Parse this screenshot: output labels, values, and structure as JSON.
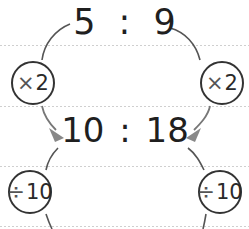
{
  "diagram": {
    "top_ratio": {
      "left": "5",
      "separator": ":",
      "right": "9"
    },
    "middle_ratio": {
      "left": "10",
      "separator": ":",
      "right": "18"
    },
    "operations": {
      "top_left": {
        "symbol": "×",
        "value": "2"
      },
      "top_right": {
        "symbol": "×",
        "value": "2"
      },
      "bottom_left": {
        "symbol": "÷",
        "value": "10"
      },
      "bottom_right": {
        "symbol": "÷",
        "value": "10"
      }
    },
    "colors": {
      "text": "#1f1f1f",
      "circle_stroke": "#333333",
      "connector": "#555555",
      "arrowhead": "#888888",
      "guide_line": "#cfcfcf"
    }
  }
}
